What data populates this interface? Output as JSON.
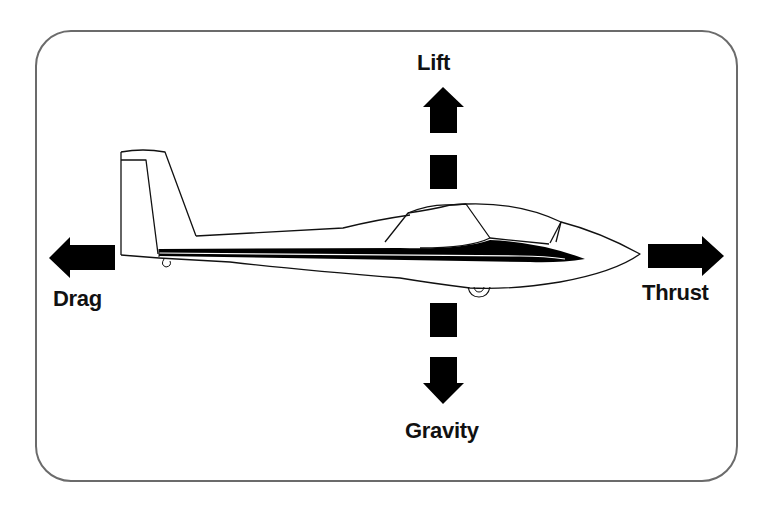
{
  "diagram": {
    "forces": {
      "lift": {
        "label": "Lift",
        "direction": "up"
      },
      "gravity": {
        "label": "Gravity",
        "direction": "down"
      },
      "drag": {
        "label": "Drag",
        "direction": "left"
      },
      "thrust": {
        "label": "Thrust",
        "direction": "right"
      }
    },
    "colors": {
      "arrow": "#000000",
      "frame_border": "#6b6b6b",
      "background": "#ffffff",
      "text": "#111111"
    }
  }
}
